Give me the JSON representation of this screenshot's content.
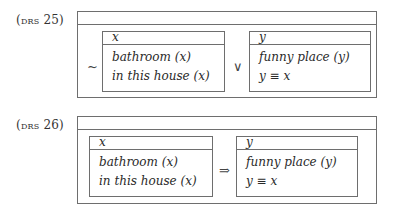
{
  "drs": [
    {
      "label_prefix": "(",
      "label_sc": "drs",
      "label_num": " 25)",
      "outer_universe": "",
      "prefix_operator": "~",
      "connective": "∨",
      "left_box": {
        "referent": "x",
        "conditions": [
          "bathroom (x)",
          "in this house (x)"
        ]
      },
      "right_box": {
        "referent": "y",
        "conditions": [
          "funny place (y)",
          "y ≡ x"
        ]
      }
    },
    {
      "label_prefix": "(",
      "label_sc": "drs",
      "label_num": " 26)",
      "outer_universe": "",
      "connective": "⇒",
      "left_box": {
        "referent": "x",
        "conditions": [
          "bathroom (x)",
          "in this house (x)"
        ]
      },
      "right_box": {
        "referent": "y",
        "conditions": [
          "funny place (y)",
          "y ≡ x"
        ]
      }
    }
  ]
}
